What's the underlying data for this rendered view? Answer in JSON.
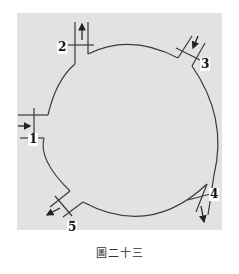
{
  "figure": {
    "caption": "圖二十三",
    "ports": [
      {
        "id": "port-1",
        "label": "1",
        "flow": "in",
        "side": "left"
      },
      {
        "id": "port-2",
        "label": "2",
        "flow": "out",
        "side": "top-left"
      },
      {
        "id": "port-3",
        "label": "3",
        "flow": "in",
        "side": "top-right"
      },
      {
        "id": "port-4",
        "label": "4",
        "flow": "out",
        "side": "bottom-right"
      },
      {
        "id": "port-5",
        "label": "5",
        "flow": "out",
        "side": "bottom-left"
      }
    ],
    "colors": {
      "line": "#3a3a3a",
      "background": "#e2e2e2",
      "page": "#ffffff"
    }
  }
}
